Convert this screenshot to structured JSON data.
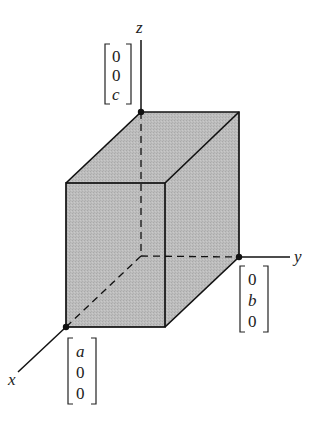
{
  "axes": {
    "x_label": "x",
    "y_label": "y",
    "z_label": "z"
  },
  "vectors": {
    "a_vector": [
      "a",
      "0",
      "0"
    ],
    "b_vector": [
      "0",
      "b",
      "0"
    ],
    "c_vector": [
      "0",
      "0",
      "c"
    ]
  },
  "colors": {
    "face_fill": "#b8b8b8",
    "stroke": "#111111"
  }
}
